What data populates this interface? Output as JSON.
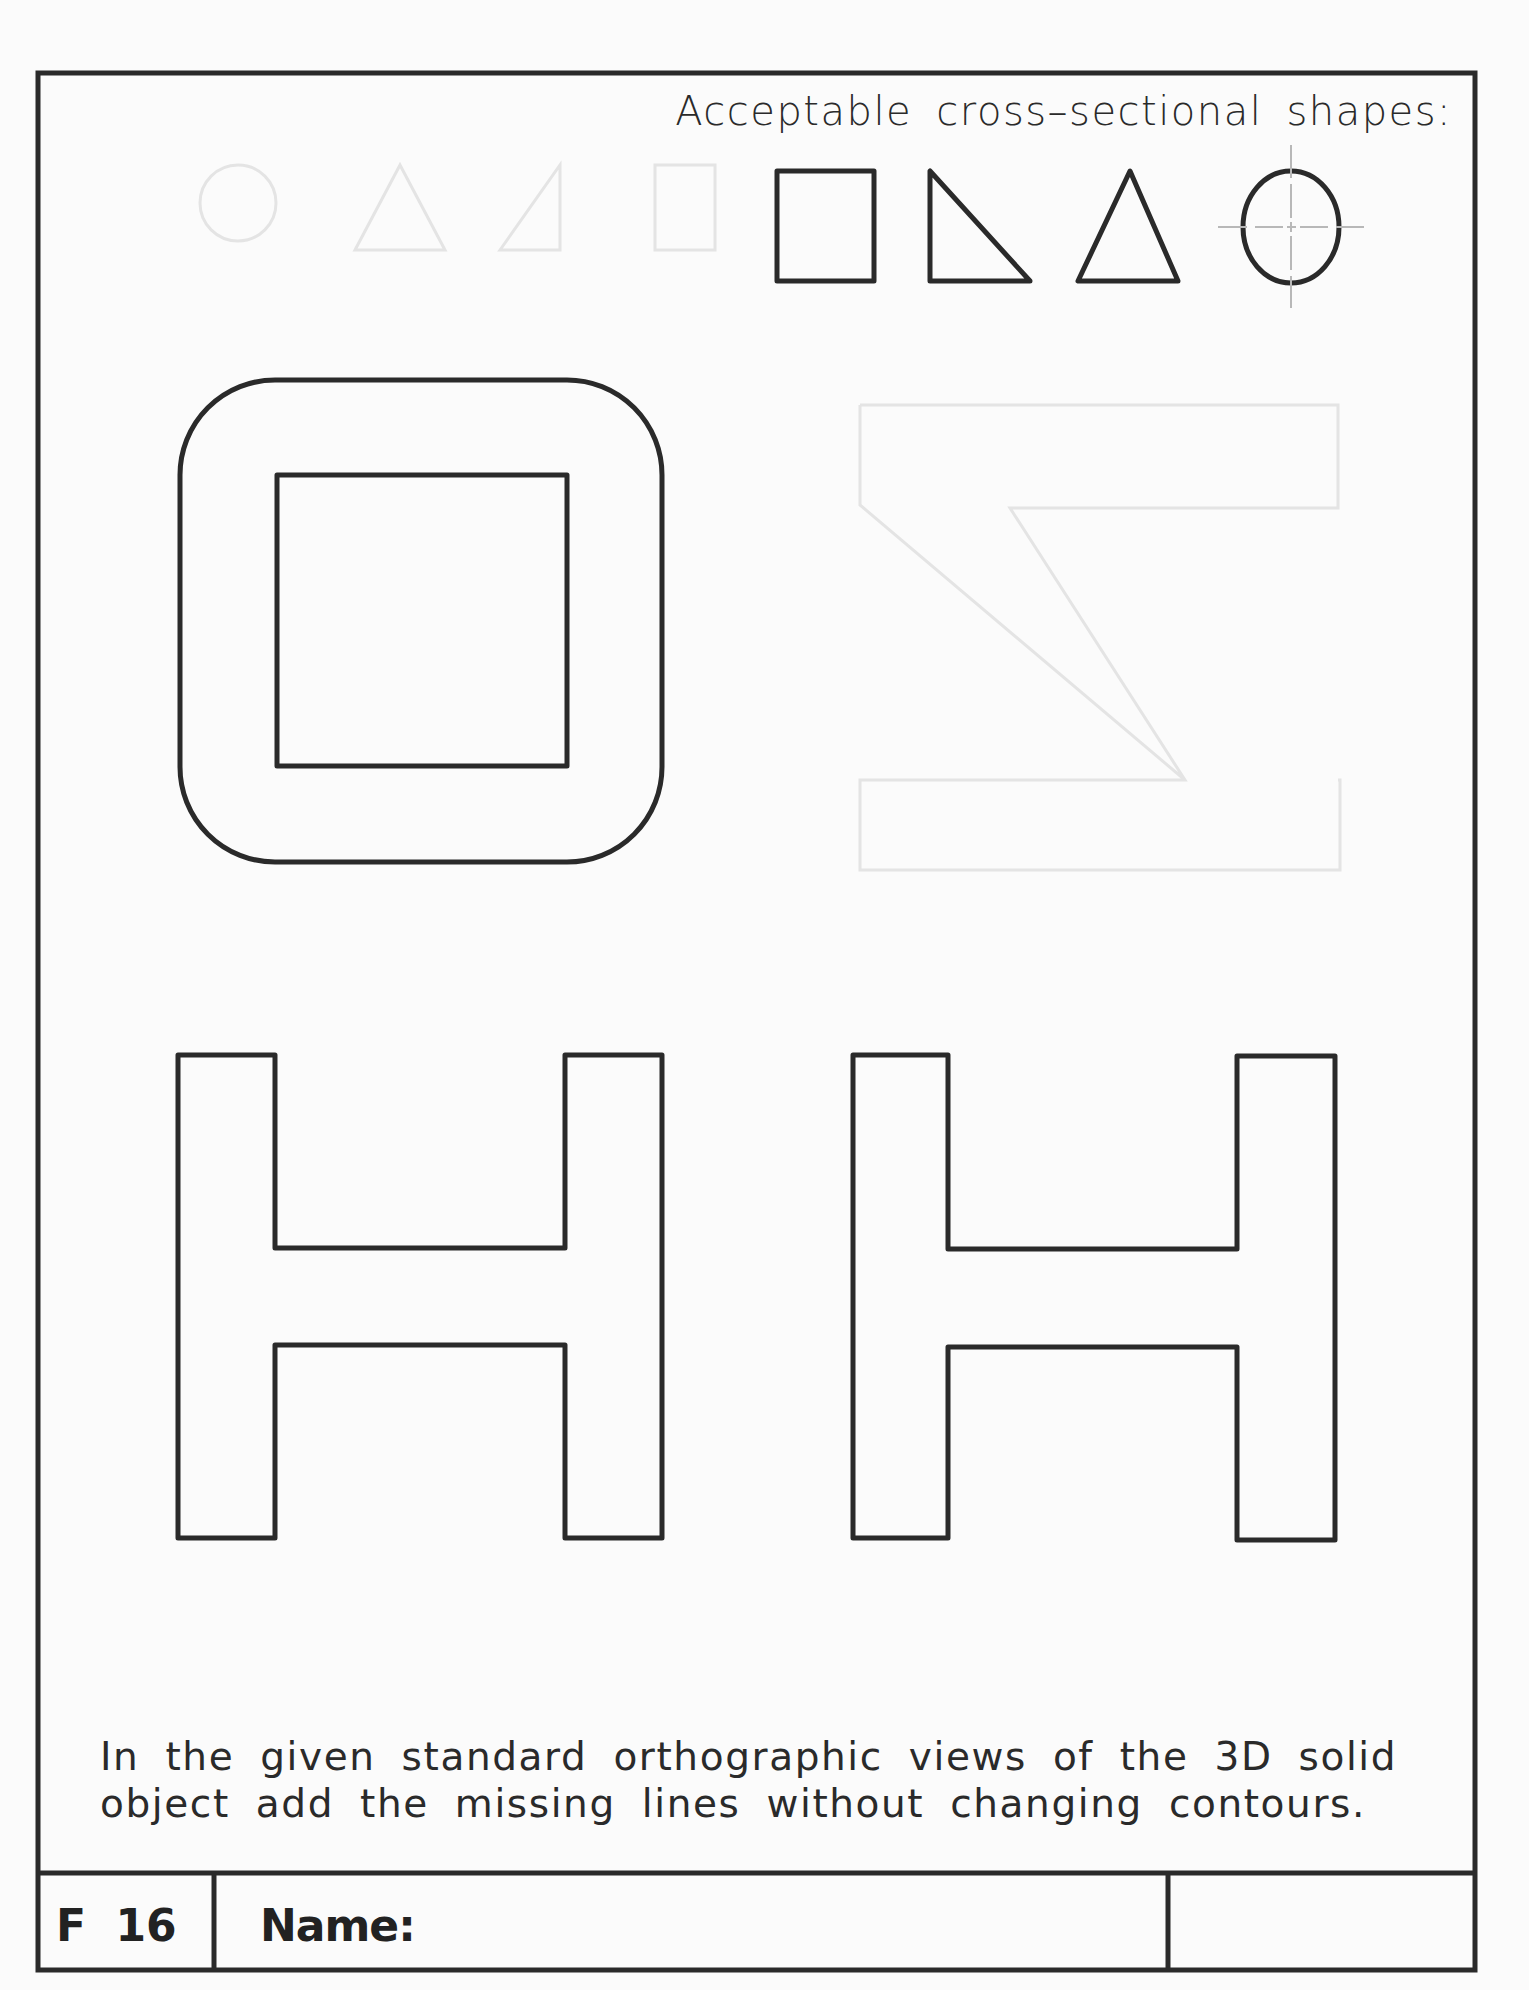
{
  "worksheet": {
    "heading": "Acceptable cross–sectional shapes:",
    "acceptable_shapes": [
      {
        "name": "square"
      },
      {
        "name": "right-triangle"
      },
      {
        "name": "triangle"
      },
      {
        "name": "circle"
      }
    ],
    "instructions": {
      "line1": "In the given standard orthographic views of the 3D solid",
      "line2": "object add the missing lines without changing contours."
    },
    "views": [
      {
        "name": "top-view",
        "shape": "rounded-square-with-inner-square"
      },
      {
        "name": "front-view",
        "shape": "H-profile"
      },
      {
        "name": "side-view",
        "shape": "H-profile"
      }
    ],
    "title_block": {
      "sheet_id": "F 16",
      "name_label": "Name:",
      "name_value": ""
    },
    "colors": {
      "ink": "#2a2a2a",
      "paper": "#fbfbfb",
      "centerline": "#b8b8b8",
      "bleed_through": "#e6e6e6"
    }
  }
}
